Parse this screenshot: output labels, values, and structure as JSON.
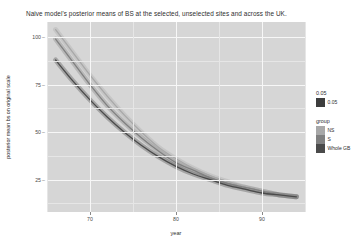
{
  "cut_header": {
    "text": "— ———— —— — ———"
  },
  "chart_data": {
    "type": "line",
    "title": "Naive model's posterior means of BS at the selected, unselected sites and across the UK.",
    "xlabel": "year",
    "ylabel": "posterior mean bs on original scale",
    "xlim": [
      1965,
      1995
    ],
    "ylim": [
      8,
      108
    ],
    "yticks": [
      25,
      50,
      75,
      100
    ],
    "ytick_labels": [
      "25",
      "50",
      "75",
      "100"
    ],
    "xticks": [
      1970,
      1980,
      1990
    ],
    "xtick_labels": [
      "70",
      "80",
      "90"
    ],
    "grid": true,
    "panel_fill": "#d6d6d6",
    "grid_major_color": "#f7f7f7",
    "grid_minor_color": "#e6e6e6",
    "legend_position": "right",
    "x": [
      1966,
      1968,
      1970,
      1972,
      1974,
      1976,
      1978,
      1980,
      1982,
      1984,
      1986,
      1988,
      1990,
      1992,
      1994
    ],
    "series": [
      {
        "name": "NS",
        "color": "#a8a8a8",
        "values": [
          104,
          92,
          80,
          69,
          59,
          50,
          42,
          36,
          31,
          27,
          24,
          21,
          19,
          17,
          16
        ]
      },
      {
        "name": "S",
        "color": "#808080",
        "values": [
          99,
          87,
          75,
          64,
          55,
          47,
          40,
          34,
          30,
          26,
          23,
          21,
          19,
          17,
          16
        ]
      },
      {
        "name": "Whole GB",
        "color": "#4a4a4a",
        "values": [
          88,
          77,
          67,
          58,
          50,
          43,
          37,
          32,
          28,
          25,
          22,
          20,
          18,
          17,
          16
        ]
      }
    ],
    "ribbon_alpha": 0.35
  },
  "legends": [
    {
      "name": "alpha-legend",
      "title": "0.05",
      "items": [
        {
          "label": "0.05",
          "color": "#3d3d3d"
        }
      ]
    },
    {
      "name": "group-legend",
      "title": "group",
      "items": [
        {
          "label": "NS",
          "color": "#a8a8a8"
        },
        {
          "label": "S",
          "color": "#808080"
        },
        {
          "label": "Whole GB",
          "color": "#4a4a4a"
        }
      ]
    }
  ]
}
